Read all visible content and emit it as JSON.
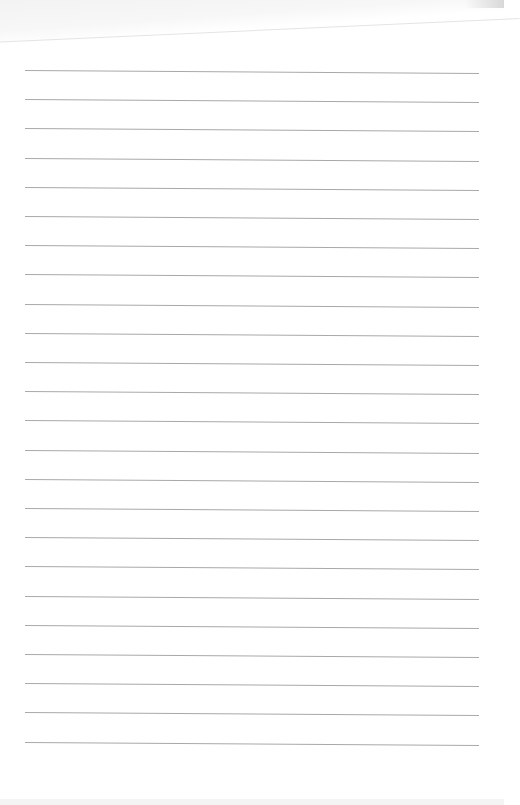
{
  "paper": {
    "type": "lined-sheet",
    "background": "#ffffff",
    "line_color": "#a9a9a9",
    "line_count": 24,
    "first_line_y": 70,
    "line_spacing": 29.2,
    "line_left": 25,
    "line_width": 454
  }
}
